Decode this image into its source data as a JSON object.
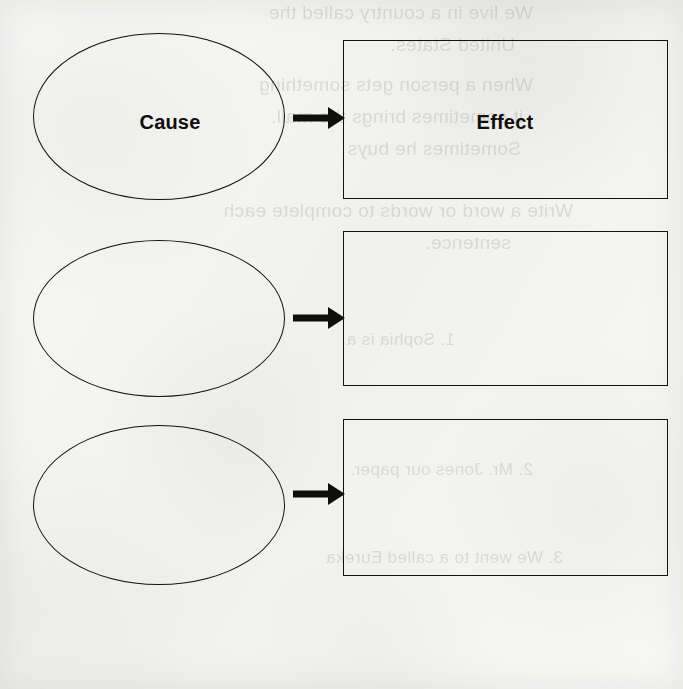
{
  "document": {
    "title": "Cause and Effect Graphic Organizer",
    "background_color": "#f2f2f0",
    "ink_color": "#100e0c"
  },
  "diagram": {
    "type": "cause-effect-organizer",
    "row_count": 3,
    "rows": [
      {
        "cause_label": "Cause",
        "effect_label": "Effect",
        "arrow_icon": "right-arrow-icon",
        "filled": true
      },
      {
        "cause_label": "",
        "effect_label": "",
        "arrow_icon": "right-arrow-icon",
        "filled": false
      },
      {
        "cause_label": "",
        "effect_label": "",
        "arrow_icon": "right-arrow-icon",
        "filled": false
      }
    ]
  },
  "bleed_through": {
    "description": "faint mirrored show-through text from the reverse side of the scanned worksheet",
    "lines": [
      "We live in a country called the",
      "United States.",
      "When a person gets something",
      "it sometimes brings the mail.",
      "Sometimes he buys",
      "Write a word or words to complete each",
      "sentence.",
      "1. Sophia is a",
      "2. Mr. Jones    our paper.",
      "3. We went to a    called Eureka"
    ]
  }
}
